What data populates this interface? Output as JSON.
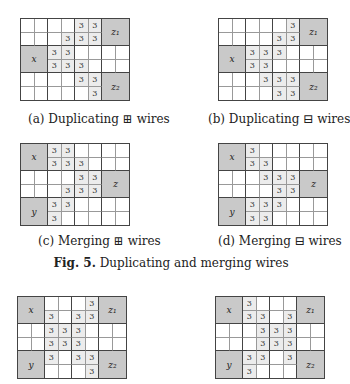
{
  "subfigures": [
    {
      "id": "a",
      "caption": "(a) Duplicating ⊞ wires",
      "left": 20,
      "top": 18,
      "cap_left": 28,
      "cap_top": 112,
      "blocks": [
        {
          "label": "z₁",
          "r": 0,
          "c": 6
        },
        {
          "label": "x",
          "r": 2,
          "c": 0
        },
        {
          "label": "z₂",
          "r": 4,
          "c": 6
        }
      ],
      "threes": [
        [
          0,
          4
        ],
        [
          0,
          5
        ],
        [
          1,
          3
        ],
        [
          1,
          4
        ],
        [
          1,
          5
        ],
        [
          2,
          2
        ],
        [
          2,
          3
        ],
        [
          3,
          2
        ],
        [
          3,
          3
        ],
        [
          3,
          4
        ],
        [
          4,
          4
        ],
        [
          4,
          5
        ],
        [
          5,
          5
        ]
      ]
    },
    {
      "id": "b",
      "caption": "(b) Duplicating ⊟ wires",
      "left": 218,
      "top": 18,
      "cap_left": 208,
      "cap_top": 112,
      "blocks": [
        {
          "label": "z₁",
          "r": 0,
          "c": 6
        },
        {
          "label": "x",
          "r": 2,
          "c": 0
        },
        {
          "label": "z₂",
          "r": 4,
          "c": 6
        }
      ],
      "threes": [
        [
          0,
          5
        ],
        [
          1,
          4
        ],
        [
          1,
          5
        ],
        [
          2,
          2
        ],
        [
          2,
          3
        ],
        [
          2,
          4
        ],
        [
          3,
          2
        ],
        [
          3,
          3
        ],
        [
          4,
          3
        ],
        [
          4,
          4
        ],
        [
          4,
          5
        ],
        [
          5,
          4
        ],
        [
          5,
          5
        ]
      ]
    },
    {
      "id": "c",
      "caption": "(c) Merging ⊞ wires",
      "left": 20,
      "top": 143,
      "cap_left": 38,
      "cap_top": 234,
      "blocks": [
        {
          "label": "x",
          "r": 0,
          "c": 0
        },
        {
          "label": "z",
          "r": 2,
          "c": 6
        },
        {
          "label": "y",
          "r": 4,
          "c": 0
        }
      ],
      "threes": [
        [
          0,
          2
        ],
        [
          0,
          3
        ],
        [
          1,
          2
        ],
        [
          1,
          3
        ],
        [
          1,
          4
        ],
        [
          2,
          4
        ],
        [
          2,
          5
        ],
        [
          3,
          3
        ],
        [
          3,
          4
        ],
        [
          3,
          5
        ],
        [
          4,
          2
        ],
        [
          4,
          3
        ],
        [
          5,
          2
        ]
      ]
    },
    {
      "id": "d",
      "caption": "(d) Merging ⊟ wires",
      "left": 218,
      "top": 143,
      "cap_left": 218,
      "cap_top": 234,
      "blocks": [
        {
          "label": "x",
          "r": 0,
          "c": 0
        },
        {
          "label": "z",
          "r": 2,
          "c": 6
        },
        {
          "label": "y",
          "r": 4,
          "c": 0
        }
      ],
      "threes": [
        [
          0,
          2
        ],
        [
          1,
          2
        ],
        [
          1,
          3
        ],
        [
          2,
          3
        ],
        [
          2,
          4
        ],
        [
          2,
          5
        ],
        [
          3,
          4
        ],
        [
          3,
          5
        ],
        [
          4,
          2
        ],
        [
          4,
          3
        ],
        [
          4,
          4
        ],
        [
          5,
          2
        ],
        [
          5,
          3
        ]
      ]
    },
    {
      "id": "e",
      "caption": "",
      "left": 17,
      "top": 296,
      "blocks": [
        {
          "label": "x",
          "r": 0,
          "c": 0
        },
        {
          "label": "z₁",
          "r": 0,
          "c": 6
        },
        {
          "label": "y",
          "r": 4,
          "c": 0
        },
        {
          "label": "z₂",
          "r": 4,
          "c": 6
        }
      ],
      "threes": [
        [
          0,
          5
        ],
        [
          1,
          2
        ],
        [
          1,
          4
        ],
        [
          1,
          5
        ],
        [
          2,
          2
        ],
        [
          2,
          3
        ],
        [
          2,
          4
        ],
        [
          3,
          2
        ],
        [
          3,
          3
        ],
        [
          3,
          4
        ],
        [
          4,
          2
        ],
        [
          4,
          4
        ],
        [
          4,
          5
        ],
        [
          5,
          5
        ]
      ]
    },
    {
      "id": "f",
      "caption": "",
      "left": 215,
      "top": 296,
      "blocks": [
        {
          "label": "x",
          "r": 0,
          "c": 0
        },
        {
          "label": "z₁",
          "r": 0,
          "c": 6
        },
        {
          "label": "y",
          "r": 4,
          "c": 0
        },
        {
          "label": "z₂",
          "r": 4,
          "c": 6
        }
      ],
      "threes": [
        [
          0,
          2
        ],
        [
          1,
          2
        ],
        [
          1,
          3
        ],
        [
          1,
          5
        ],
        [
          2,
          3
        ],
        [
          2,
          4
        ],
        [
          2,
          5
        ],
        [
          3,
          3
        ],
        [
          3,
          4
        ],
        [
          3,
          5
        ],
        [
          4,
          2
        ],
        [
          4,
          3
        ],
        [
          4,
          5
        ],
        [
          5,
          2
        ]
      ]
    }
  ],
  "figure_caption": {
    "label": "Fig. 5.",
    "text": " Duplicating and merging wires"
  },
  "cell_value": "3"
}
